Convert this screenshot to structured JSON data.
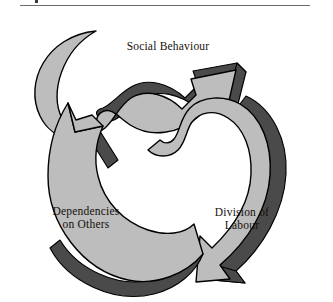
{
  "page": {
    "has_header_rule": true,
    "background_color": "#ffffff"
  },
  "diagram": {
    "type": "cyclical-arrow-diagram",
    "title": "",
    "arrow_count": 3,
    "direction": "clockwise",
    "colors": {
      "arrow_fill": "#bdbdbd",
      "arrow_shadow": "#4a4a4a",
      "arrow_outline": "#000000",
      "text": "#15100c",
      "background": "#ffffff"
    },
    "nodes": [
      {
        "id": "social-behaviour",
        "label": "Social Behaviour",
        "position": "top"
      },
      {
        "id": "division-of-labour",
        "label": "Division of\nLabour",
        "position": "bottom-right"
      },
      {
        "id": "dependencies-on-others",
        "label": "Dependencies\non Others",
        "position": "bottom-left"
      }
    ]
  }
}
